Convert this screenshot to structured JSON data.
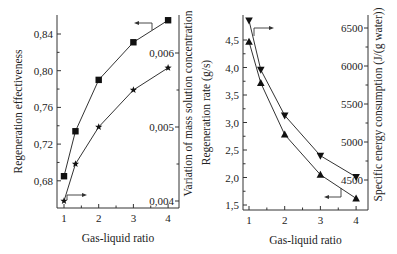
{
  "chart_data": [
    {
      "type": "line",
      "title": "",
      "xlabel": "Gas-liquid ratio",
      "ylabel": "Regeneration effectiveness",
      "y2label": "Variation of mass solution concentration",
      "x": [
        1,
        1.33,
        2,
        3,
        4
      ],
      "xticks": [
        "1",
        "2",
        "3",
        "4"
      ],
      "xlim": [
        0.9,
        4.2
      ],
      "ylim": [
        0.655,
        0.862
      ],
      "y2lim": [
        0.00397,
        0.00637
      ],
      "yticks": [
        "0,68",
        "0,72",
        "0,76",
        "0,80",
        "0,84"
      ],
      "y2ticks": [
        "0,004",
        "0,005",
        "0,006"
      ],
      "series": [
        {
          "name": "Regeneration effectiveness",
          "axis": "left",
          "marker": "square",
          "values": [
            0.685,
            0.734,
            0.79,
            0.831,
            0.855
          ]
        },
        {
          "name": "Variation of mass solution concentration",
          "axis": "right",
          "marker": "star",
          "values": [
            0.004,
            0.0045,
            0.005,
            0.0055,
            0.0058
          ]
        }
      ],
      "grid": false
    },
    {
      "type": "line",
      "title": "",
      "xlabel": "Gas-liquid ratio",
      "ylabel": "Regeneration rate (g/s)",
      "y2label": "Specific energy consumption (J/(g water))",
      "x": [
        1,
        1.33,
        2,
        3,
        4
      ],
      "xticks": [
        "1",
        "2",
        "3",
        "4"
      ],
      "xlim": [
        0.9,
        4.1
      ],
      "ylim": [
        1.4,
        4.9
      ],
      "y2lim": [
        4300,
        6650
      ],
      "yticks": [
        "1,5",
        "2,0",
        "2,5",
        "3,0",
        "3,5",
        "4,0",
        "4,5"
      ],
      "y2ticks": [
        "4500",
        "5000",
        "5500",
        "6000",
        "6500"
      ],
      "series": [
        {
          "name": "Regeneration rate",
          "axis": "left",
          "marker": "triangle-up",
          "values": [
            4.47,
            3.72,
            2.78,
            2.05,
            1.62
          ]
        },
        {
          "name": "Specific energy consumption",
          "axis": "right",
          "marker": "triangle-down",
          "values": [
            6600,
            5950,
            5350,
            4820,
            4540
          ]
        }
      ],
      "grid": false
    }
  ]
}
